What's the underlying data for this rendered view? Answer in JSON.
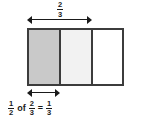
{
  "figure": {
    "type": "fraction-area-model",
    "top_label": {
      "numerator": "2",
      "denominator": "3",
      "text": "2/3"
    },
    "bars": {
      "total_parts": 3,
      "cells": [
        {
          "index": 1,
          "fill_label": "dark-shaded",
          "color": "#c9c9c9"
        },
        {
          "index": 2,
          "fill_label": "light-shaded",
          "color": "#f2f2f2"
        },
        {
          "index": 3,
          "fill_label": "unshaded",
          "color": "#ffffff"
        }
      ],
      "border_color": "#3c3c3c"
    },
    "arrows": {
      "top": {
        "name": "two-thirds-span",
        "spans_parts": 2
      },
      "bottom": {
        "name": "one-third-span",
        "spans_parts": 1
      }
    },
    "equation": {
      "text": "1/2 of 2/3 = 1/3",
      "first_fraction": {
        "numerator": "1",
        "denominator": "2"
      },
      "operator_word": "of",
      "second_fraction": {
        "numerator": "2",
        "denominator": "3"
      },
      "equals": "=",
      "result_fraction": {
        "numerator": "1",
        "denominator": "3"
      }
    }
  }
}
